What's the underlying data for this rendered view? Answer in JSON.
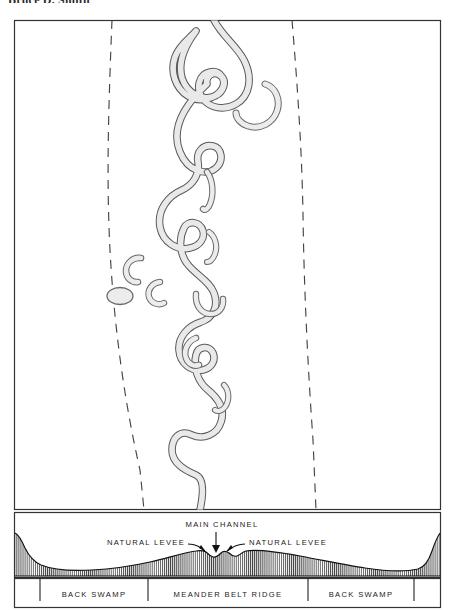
{
  "page": {
    "top_caption": "Bruce D. Smith",
    "figure_title": "Meander belt map with floodplain cross-section"
  },
  "map": {
    "frame": {
      "x": 14,
      "y": 20,
      "w": 427,
      "h": 490
    },
    "features": {
      "active_channel": "meandering-river-channel",
      "oxbow_lakes_count": 9,
      "meander_belt_boundary_left": "dashed-line-left",
      "meander_belt_boundary_right": "dashed-line-right"
    },
    "colors": {
      "channel_fill": "#e7e7e7",
      "channel_stroke": "#555555",
      "frame_stroke": "#333333",
      "dashed_stroke": "#444444",
      "background": "#ffffff"
    }
  },
  "cross_section": {
    "frame": {
      "x": 14,
      "y": 512,
      "w": 427,
      "h": 66
    },
    "annotations": [
      {
        "id": "main-channel",
        "text": "MAIN  CHANNEL",
        "x": 222,
        "y": 526,
        "anchor": "middle"
      },
      {
        "id": "natural-levee-left",
        "text": "NATURAL  LEVEE",
        "x": 185,
        "y": 546,
        "anchor": "end"
      },
      {
        "id": "natural-levee-right",
        "text": "NATURAL  LEVEE",
        "x": 248,
        "y": 546,
        "anchor": "start"
      }
    ],
    "profile_description": "hachured floodplain profile with two bluffs, broad back swamps, meander belt ridge, natural levees flanking main channel",
    "colors": {
      "hachure": "#2a2a2a",
      "surface_stroke": "#1a1a1a",
      "frame_stroke": "#333333"
    }
  },
  "zones": {
    "frame": {
      "x": 14,
      "y": 578,
      "w": 427,
      "h": 30
    },
    "items": [
      {
        "id": "zone-back-swamp-left",
        "label": "BACK  SWAMP",
        "x": 107,
        "y": 596
      },
      {
        "id": "zone-meander-belt-ridge",
        "label": "MEANDER  BELT  RIDGE",
        "x": 228,
        "y": 596
      },
      {
        "id": "zone-back-swamp-right",
        "label": "BACK  SWAMP",
        "x": 348,
        "y": 596
      }
    ],
    "dividers_x": [
      40,
      148,
      308,
      414
    ]
  }
}
